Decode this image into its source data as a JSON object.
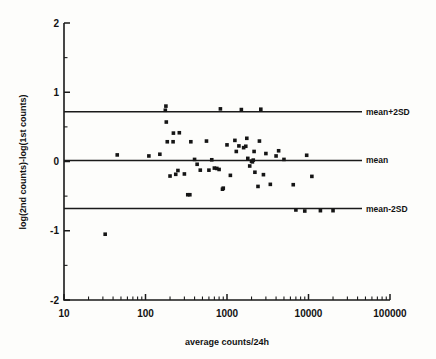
{
  "chart_data": {
    "type": "scatter",
    "title": "",
    "subtitle": "",
    "xlabel": "average counts/24h",
    "ylabel": "log(2nd counts)-log(1st counts)",
    "xscale": "log",
    "yscale": "linear",
    "xlim": [
      10,
      100000
    ],
    "ylim": [
      -2,
      2
    ],
    "grid": false,
    "legend": "none",
    "xticks": [
      {
        "value": 10,
        "label": "10"
      },
      {
        "value": 100,
        "label": "100"
      },
      {
        "value": 1000,
        "label": "1000"
      },
      {
        "value": 10000,
        "label": "10000"
      },
      {
        "value": 100000,
        "label": "100000"
      }
    ],
    "yticks": [
      {
        "value": 2,
        "label": "2"
      },
      {
        "value": 1.5,
        "label": ""
      },
      {
        "value": 1,
        "label": "1"
      },
      {
        "value": 0.5,
        "label": ""
      },
      {
        "value": 0,
        "label": "0"
      },
      {
        "value": -0.5,
        "label": ""
      },
      {
        "value": -1,
        "label": "-1"
      },
      {
        "value": -1.5,
        "label": ""
      },
      {
        "value": -2,
        "label": "-2"
      }
    ],
    "reference_lines": [
      {
        "name": "mean+2SD",
        "label": "mean+2SD",
        "y": 0.72
      },
      {
        "name": "mean",
        "label": "mean",
        "y": 0.015
      },
      {
        "name": "mean-2SD",
        "label": "mean-2SD",
        "y": -0.68
      }
    ],
    "series": [
      {
        "name": "agreement",
        "marker": "square",
        "color": "#151515",
        "points": [
          [
            32,
            -1.05
          ],
          [
            45,
            0.095
          ],
          [
            110,
            0.08
          ],
          [
            150,
            0.105
          ],
          [
            175,
            0.74
          ],
          [
            178,
            0.8
          ],
          [
            180,
            0.57
          ],
          [
            185,
            0.285
          ],
          [
            200,
            -0.21
          ],
          [
            218,
            0.285
          ],
          [
            220,
            0.41
          ],
          [
            235,
            -0.185
          ],
          [
            250,
            -0.13
          ],
          [
            260,
            0.415
          ],
          [
            300,
            -0.18
          ],
          [
            330,
            -0.48
          ],
          [
            350,
            -0.48
          ],
          [
            360,
            0.285
          ],
          [
            400,
            0.03
          ],
          [
            430,
            -0.04
          ],
          [
            470,
            -0.125
          ],
          [
            560,
            0.295
          ],
          [
            600,
            -0.125
          ],
          [
            650,
            0.025
          ],
          [
            700,
            -0.095
          ],
          [
            750,
            -0.1
          ],
          [
            800,
            -0.115
          ],
          [
            830,
            0.76
          ],
          [
            880,
            -0.4
          ],
          [
            900,
            -0.385
          ],
          [
            1000,
            0.24
          ],
          [
            1100,
            -0.2
          ],
          [
            1250,
            0.305
          ],
          [
            1300,
            0.145
          ],
          [
            1400,
            0.225
          ],
          [
            1500,
            0.75
          ],
          [
            1600,
            0.2
          ],
          [
            1700,
            0.22
          ],
          [
            1750,
            0.335
          ],
          [
            1800,
            0.045
          ],
          [
            1900,
            -0.065
          ],
          [
            2000,
            0.005
          ],
          [
            2050,
            -0.005
          ],
          [
            2100,
            0.02
          ],
          [
            2150,
            0.145
          ],
          [
            2200,
            -0.155
          ],
          [
            2400,
            -0.36
          ],
          [
            2500,
            0.295
          ],
          [
            2600,
            0.755
          ],
          [
            2800,
            -0.19
          ],
          [
            3000,
            0.115
          ],
          [
            3400,
            -0.33
          ],
          [
            4000,
            0.08
          ],
          [
            4300,
            0.155
          ],
          [
            5000,
            0.03
          ],
          [
            6500,
            -0.335
          ],
          [
            7000,
            -0.7
          ],
          [
            9000,
            -0.715
          ],
          [
            9500,
            0.09
          ],
          [
            11000,
            -0.215
          ],
          [
            14000,
            -0.71
          ],
          [
            20000,
            -0.71
          ]
        ]
      }
    ]
  },
  "geometry": {
    "plot_left_px": 64,
    "plot_right_px": 390,
    "plot_top_px": 23,
    "plot_bottom_px": 300
  }
}
